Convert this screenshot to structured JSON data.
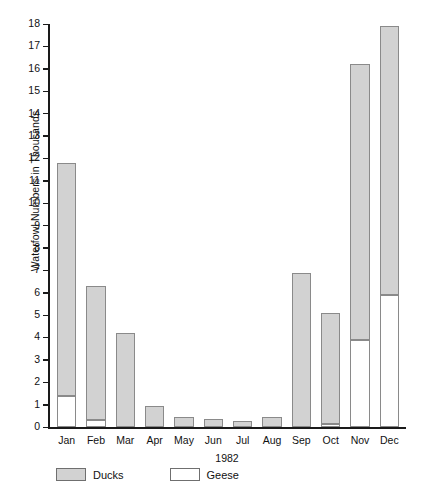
{
  "chart_data": {
    "type": "bar",
    "title": "",
    "subtitle": "",
    "xlabel": "1982",
    "ylabel": "Waterfowl Numbers in Thousands",
    "ylim": [
      0,
      18
    ],
    "ytick_step": 1,
    "grid": false,
    "stacked": true,
    "legend_position": "bottom-left",
    "categories": [
      "Jan",
      "Feb",
      "Mar",
      "Apr",
      "May",
      "Jun",
      "Jul",
      "Aug",
      "Sep",
      "Oct",
      "Nov",
      "Dec"
    ],
    "yticks": [
      "0",
      "1",
      "2",
      "3",
      "4",
      "5",
      "6",
      "7",
      "8",
      "9",
      "10",
      "11",
      "12",
      "13",
      "14",
      "15",
      "16",
      "17",
      "18"
    ],
    "series": [
      {
        "name": "Geese",
        "color": "#ffffff",
        "values": [
          1.4,
          0.3,
          0.0,
          0.0,
          0.0,
          0.0,
          0.0,
          0.0,
          0.0,
          0.15,
          3.9,
          5.9
        ]
      },
      {
        "name": "Ducks",
        "color": "#d2d2d2",
        "values": [
          10.4,
          6.0,
          4.2,
          0.95,
          0.45,
          0.35,
          0.25,
          0.45,
          6.9,
          4.95,
          12.3,
          12.0
        ]
      }
    ],
    "totals": [
      11.8,
      6.3,
      4.2,
      0.95,
      0.45,
      0.35,
      0.25,
      0.45,
      6.9,
      5.1,
      16.2,
      17.9
    ]
  },
  "legend": {
    "items": [
      {
        "label": "Ducks",
        "swatch": "gray-filled-swatch"
      },
      {
        "label": "Geese",
        "swatch": "white-filled-swatch"
      }
    ]
  },
  "colors": {
    "ducks_fill": "#d2d2d2",
    "geese_fill": "#ffffff",
    "bar_outline": "#8a8a8a",
    "axis": "#1a1a1a",
    "background": "#ffffff",
    "text": "#111111"
  }
}
